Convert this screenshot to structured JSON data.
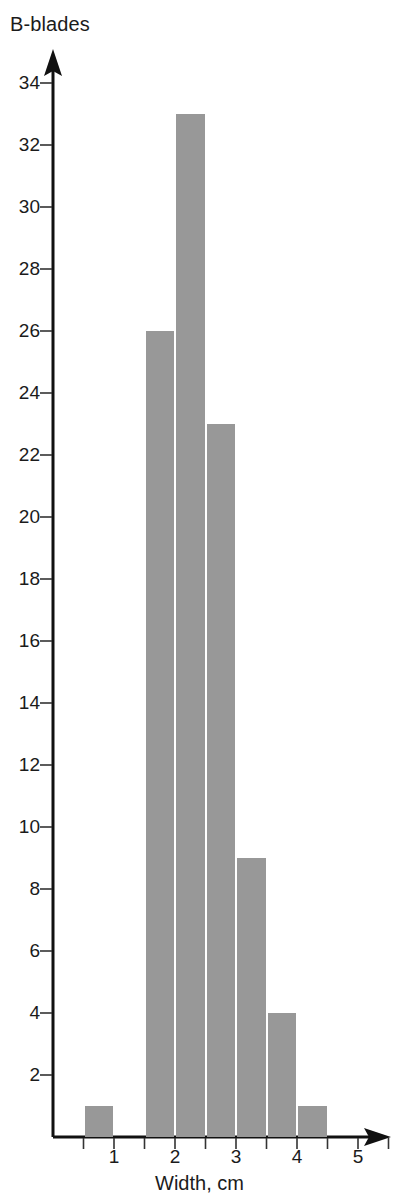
{
  "chart_data": {
    "type": "bar",
    "title": "",
    "ylabel": "B-blades",
    "xlabel": "Width, cm",
    "grid": false,
    "legend": null,
    "bin_width": 0.5,
    "x": [
      0.75,
      1.25,
      1.75,
      2.25,
      2.75,
      3.25,
      3.75,
      4.25
    ],
    "bin_edges": [
      0.5,
      1.0,
      1.5,
      2.0,
      2.5,
      3.0,
      3.5,
      4.0,
      4.5
    ],
    "categories": [
      "0.5-1.0",
      "1.0-1.5",
      "1.5-2.0",
      "2.0-2.5",
      "2.5-3.0",
      "3.0-3.5",
      "3.5-4.0",
      "4.0-4.5"
    ],
    "values": [
      1,
      0,
      26,
      33,
      23,
      9,
      4,
      1
    ],
    "bars": [
      {
        "left": 0.5,
        "right": 1.0,
        "value": 1
      },
      {
        "left": 1.5,
        "right": 2.0,
        "value": 26
      },
      {
        "left": 2.0,
        "right": 2.5,
        "value": 33
      },
      {
        "left": 2.5,
        "right": 3.0,
        "value": 23
      },
      {
        "left": 3.0,
        "right": 3.5,
        "value": 9
      },
      {
        "left": 3.5,
        "right": 4.0,
        "value": 4
      },
      {
        "left": 4.0,
        "right": 4.5,
        "value": 1
      }
    ],
    "ylim": [
      0,
      35
    ],
    "xlim": [
      0,
      5.8
    ],
    "ytick_values": [
      2,
      4,
      6,
      8,
      10,
      12,
      14,
      16,
      18,
      20,
      22,
      24,
      26,
      28,
      30,
      32,
      34
    ],
    "ytick_labels": [
      "2",
      "4",
      "6",
      "8",
      "10",
      "12",
      "14",
      "16",
      "18",
      "20",
      "22",
      "24",
      "26",
      "28",
      "30",
      "32",
      "34"
    ],
    "xtick_values": [
      0.5,
      1,
      1.5,
      2,
      2.5,
      3,
      3.5,
      4,
      4.5,
      5,
      5.5
    ],
    "xtick_labeled": [
      1,
      2,
      3,
      4,
      5
    ],
    "xtick_labels": [
      "1",
      "2",
      "3",
      "4",
      "5"
    ],
    "bar_color": "#989898",
    "axis_color": "#111111"
  }
}
